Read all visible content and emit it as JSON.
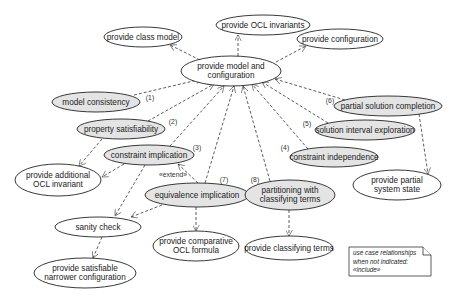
{
  "diagram": {
    "type": "uml-use-case",
    "nodes": [
      {
        "id": "provide-ocl-invariants",
        "lines": [
          "provide OCL invariants"
        ],
        "cx": 263,
        "cy": 25,
        "rx": 47,
        "ry": 10,
        "style": "plain"
      },
      {
        "id": "provide-class-model",
        "lines": [
          "provide class model"
        ],
        "cx": 143,
        "cy": 37,
        "rx": 39,
        "ry": 10,
        "style": "plain"
      },
      {
        "id": "provide-configuration",
        "lines": [
          "provide configuration"
        ],
        "cx": 340,
        "cy": 39,
        "rx": 43,
        "ry": 10,
        "style": "plain"
      },
      {
        "id": "provide-model-and-configuration",
        "lines": [
          "provide model and",
          "configuration"
        ],
        "cx": 231,
        "cy": 71,
        "rx": 50,
        "ry": 15,
        "style": "plain"
      },
      {
        "id": "model-consistency",
        "lines": [
          "model consistency"
        ],
        "cx": 96,
        "cy": 102,
        "rx": 44,
        "ry": 10,
        "style": "gray"
      },
      {
        "id": "property-satisfiability",
        "lines": [
          "property satisfiability"
        ],
        "cx": 121,
        "cy": 129,
        "rx": 44,
        "ry": 10,
        "style": "gray"
      },
      {
        "id": "constraint-implication",
        "lines": [
          "constraint implication"
        ],
        "cx": 149,
        "cy": 155,
        "rx": 45,
        "ry": 10,
        "style": "gray"
      },
      {
        "id": "provide-additional-ocl-invariant",
        "lines": [
          "provide additional",
          "OCL invariant"
        ],
        "cx": 58,
        "cy": 180,
        "rx": 43,
        "ry": 16,
        "style": "plain"
      },
      {
        "id": "equivalence-implication",
        "lines": [
          "equivalence implication"
        ],
        "cx": 197,
        "cy": 195,
        "rx": 52,
        "ry": 12,
        "style": "gray"
      },
      {
        "id": "partitioning-with-classifying-terms",
        "lines": [
          "partitioning with",
          "classifying terms"
        ],
        "cx": 290,
        "cy": 195,
        "rx": 45,
        "ry": 15,
        "style": "gray"
      },
      {
        "id": "constraint-independence",
        "lines": [
          "constraint independence"
        ],
        "cx": 334,
        "cy": 157,
        "rx": 44,
        "ry": 10,
        "style": "gray"
      },
      {
        "id": "solution-interval-exploration",
        "lines": [
          "solution interval exploration"
        ],
        "cx": 365,
        "cy": 130,
        "rx": 50,
        "ry": 10,
        "style": "gray"
      },
      {
        "id": "partial-solution-completion",
        "lines": [
          "partial solution completion"
        ],
        "cx": 388,
        "cy": 106,
        "rx": 54,
        "ry": 10,
        "style": "gray"
      },
      {
        "id": "provide-partial-system-state",
        "lines": [
          "provide partial",
          "system state"
        ],
        "cx": 397,
        "cy": 185,
        "rx": 44,
        "ry": 15,
        "style": "plain"
      },
      {
        "id": "sanity-check",
        "lines": [
          "sanity check"
        ],
        "cx": 98,
        "cy": 227,
        "rx": 43,
        "ry": 10,
        "style": "plain"
      },
      {
        "id": "provide-comparative-ocl-formula",
        "lines": [
          "provide comparative",
          "OCL formula"
        ],
        "cx": 196,
        "cy": 246,
        "rx": 43,
        "ry": 15,
        "style": "plain"
      },
      {
        "id": "provide-classifying-terms",
        "lines": [
          "provide classifying terms"
        ],
        "cx": 289,
        "cy": 248,
        "rx": 44,
        "ry": 12,
        "style": "plain"
      },
      {
        "id": "provide-satisfiable-narrower-configuration",
        "lines": [
          "provide satisfiable",
          "narrower configuration"
        ],
        "cx": 85,
        "cy": 273,
        "rx": 51,
        "ry": 15,
        "style": "plain"
      }
    ],
    "edges": [
      {
        "from": "provide-model-and-configuration",
        "to": "provide-class-model",
        "x1": 200,
        "y1": 60,
        "x2": 170,
        "y2": 45
      },
      {
        "from": "provide-model-and-configuration",
        "to": "provide-ocl-invariants",
        "x1": 238,
        "y1": 56,
        "x2": 238,
        "y2": 35
      },
      {
        "from": "provide-model-and-configuration",
        "to": "provide-configuration",
        "x1": 276,
        "y1": 62,
        "x2": 306,
        "y2": 46
      },
      {
        "from": "model-consistency",
        "to": "provide-model-and-configuration",
        "x1": 134,
        "y1": 95,
        "x2": 202,
        "y2": 79
      },
      {
        "from": "property-satisfiability",
        "to": "provide-model-and-configuration",
        "x1": 148,
        "y1": 121,
        "x2": 214,
        "y2": 84
      },
      {
        "from": "constraint-implication",
        "to": "provide-model-and-configuration",
        "x1": 170,
        "y1": 146,
        "x2": 224,
        "y2": 86
      },
      {
        "from": "equivalence-implication",
        "to": "provide-model-and-configuration",
        "x1": 205,
        "y1": 183,
        "x2": 234,
        "y2": 86
      },
      {
        "from": "partitioning-with-classifying-terms",
        "to": "provide-model-and-configuration",
        "x1": 270,
        "y1": 181,
        "x2": 243,
        "y2": 86
      },
      {
        "from": "constraint-independence",
        "to": "provide-model-and-configuration",
        "x1": 308,
        "y1": 149,
        "x2": 252,
        "y2": 84
      },
      {
        "from": "solution-interval-exploration",
        "to": "provide-model-and-configuration",
        "x1": 328,
        "y1": 123,
        "x2": 262,
        "y2": 82
      },
      {
        "from": "partial-solution-completion",
        "to": "provide-model-and-configuration",
        "x1": 345,
        "y1": 100,
        "x2": 275,
        "y2": 79
      },
      {
        "from": "property-satisfiability",
        "to": "provide-additional-ocl-invariant",
        "x1": 102,
        "y1": 139,
        "x2": 79,
        "y2": 166
      },
      {
        "from": "constraint-implication",
        "to": "provide-additional-ocl-invariant",
        "x1": 124,
        "y1": 164,
        "x2": 102,
        "y2": 177
      },
      {
        "from": "constraint-implication",
        "to": "sanity-check",
        "x1": 145,
        "y1": 165,
        "x2": 115,
        "y2": 216
      },
      {
        "from": "equivalence-implication",
        "to": "sanity-check",
        "x1": 162,
        "y1": 205,
        "x2": 131,
        "y2": 217
      },
      {
        "from": "equivalence-implication",
        "to": "constraint-implication",
        "x1": 198,
        "y1": 183,
        "x2": 178,
        "y2": 164,
        "label_key": "extend"
      },
      {
        "from": "equivalence-implication",
        "to": "provide-comparative-ocl-formula",
        "x1": 196,
        "y1": 207,
        "x2": 196,
        "y2": 231
      },
      {
        "from": "sanity-check",
        "to": "provide-satisfiable-narrower-configuration",
        "x1": 102,
        "y1": 237,
        "x2": 93,
        "y2": 258
      },
      {
        "from": "partitioning-with-classifying-terms",
        "to": "provide-classifying-terms",
        "x1": 289,
        "y1": 210,
        "x2": 289,
        "y2": 236
      },
      {
        "from": "partial-solution-completion",
        "to": "provide-partial-system-state",
        "x1": 419,
        "y1": 114,
        "x2": 428,
        "y2": 174
      }
    ],
    "numbers": [
      {
        "text": "(1)",
        "x": 150,
        "y": 98
      },
      {
        "text": "(2)",
        "x": 173,
        "y": 122
      },
      {
        "text": "(3)",
        "x": 197,
        "y": 148
      },
      {
        "text": "(4)",
        "x": 285,
        "y": 148
      },
      {
        "text": "(5)",
        "x": 307,
        "y": 124
      },
      {
        "text": "(6)",
        "x": 330,
        "y": 101
      },
      {
        "text": "(7)",
        "x": 224,
        "y": 180
      },
      {
        "text": "(8)",
        "x": 255,
        "y": 180
      }
    ],
    "labels": {
      "extend": "«extend»"
    },
    "extend_label_pos": {
      "x": 173,
      "y": 175
    },
    "note": {
      "lines": [
        "use case relationships",
        "when not indicated:",
        "«include»"
      ],
      "x": 349,
      "y": 247,
      "w": 82,
      "h": 29,
      "fold": 8
    },
    "colors": {
      "gray_fill": "#e4e4e4",
      "stroke": "#222222"
    }
  }
}
